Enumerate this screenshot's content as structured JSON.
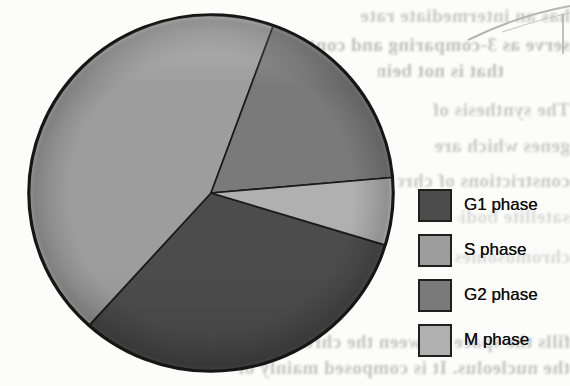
{
  "page": {
    "kind": "scanned textbook figure",
    "background_color": "#fcfcfb"
  },
  "chart_data": {
    "type": "pie",
    "title": "",
    "legend_position": "right",
    "angle_reference": "degrees clockwise from 12 o'clock",
    "outline_color": "#1b1b1b",
    "slices": [
      {
        "label": "G1 phase",
        "percent": 32,
        "color": "#4c4c4c",
        "start_deg": 107,
        "end_deg": 222
      },
      {
        "label": "S phase",
        "percent": 44,
        "color": "#9d9d9d",
        "start_deg": 222,
        "end_deg": 380
      },
      {
        "label": "G2 phase",
        "percent": 18,
        "color": "#7a7a7a",
        "start_deg": 20,
        "end_deg": 85
      },
      {
        "label": "M phase",
        "percent": 6,
        "color": "#b0b0b0",
        "start_deg": 85,
        "end_deg": 107
      }
    ]
  },
  "background": {
    "bleed_text": {
      "note": "faint mirrored show-through text from reverse side of page",
      "color": "#979797",
      "lines": [
        "has an intermediate rate",
        "serve as 3-comparing and contains DNA",
        "that is not being established",
        "The synthesis of ribosomal RNA is regulated",
        "genes which are located at the secondary",
        "constrictions of chromosomes, which are",
        "satellite bodies on their short arms, i.e.",
        "chromosomes 13, 14, 15, 21, and 22",
        "fills the space between the chromatin and",
        "the nucleolus. It is composed mainly of"
      ]
    }
  }
}
